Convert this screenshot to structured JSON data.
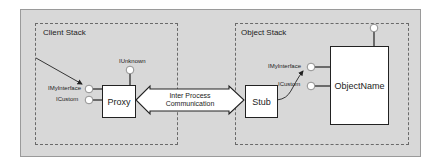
{
  "diagram": {
    "client_stack": {
      "title": "Client Stack",
      "proxy_label": "Proxy",
      "interfaces": [
        "IMyInterface",
        "ICustom"
      ],
      "top_interface": "IUnknown"
    },
    "object_stack": {
      "title": "Object Stack",
      "stub_label": "Stub",
      "object_label": "ObjectName",
      "interfaces": [
        "IMyInterface",
        "ICustom"
      ]
    },
    "ipc": {
      "line1": "Inter Process",
      "line2": "Communication"
    },
    "colors": {
      "frame_bg": "#d8d8d8",
      "box_bg": "#ffffff",
      "stroke": "#222222",
      "dash": "#6a6a6a"
    }
  }
}
